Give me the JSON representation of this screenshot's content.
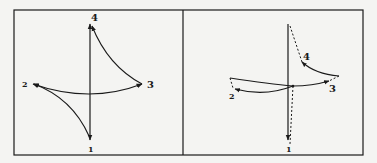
{
  "figure": {
    "panels": [
      {
        "id": "left",
        "labels": {
          "p1": "1",
          "p2": "2",
          "p3": "3",
          "p4": "4"
        }
      },
      {
        "id": "right",
        "labels": {
          "p1": "1",
          "p2": "2",
          "p3": "3",
          "p4": "4"
        }
      }
    ],
    "colors": {
      "ink": "#1a1a1a",
      "background": "#f4f4f2"
    }
  }
}
